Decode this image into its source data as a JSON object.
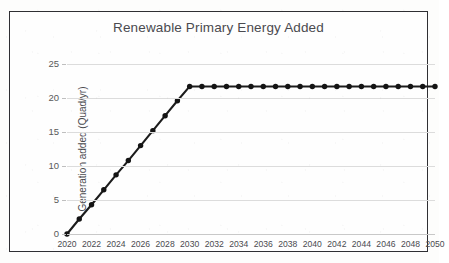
{
  "chart_data": {
    "type": "line",
    "title": "Renewable Primary Energy Added",
    "xlabel": "",
    "ylabel": "Generation added (Quad/yr)",
    "xlim": [
      2020,
      2050
    ],
    "ylim": [
      0,
      25
    ],
    "grid": true,
    "legend": false,
    "legend_position": "none",
    "marker": "circle",
    "line_color": "#1c1c1c",
    "x_tick_labels": [
      "2020",
      "2022",
      "2024",
      "2026",
      "2028",
      "2030",
      "2032",
      "2034",
      "2036",
      "2038",
      "2040",
      "2042",
      "2044",
      "2046",
      "2048",
      "2050"
    ],
    "x_tick_values": [
      2020,
      2022,
      2024,
      2026,
      2028,
      2030,
      2032,
      2034,
      2036,
      2038,
      2040,
      2042,
      2044,
      2046,
      2048,
      2050
    ],
    "y_tick_labels": [
      "0",
      "5",
      "10",
      "15",
      "20",
      "25"
    ],
    "y_tick_values": [
      0,
      5,
      10,
      15,
      20,
      25
    ],
    "x": [
      2020,
      2021,
      2022,
      2023,
      2024,
      2025,
      2026,
      2027,
      2028,
      2029,
      2030,
      2031,
      2032,
      2033,
      2034,
      2035,
      2036,
      2037,
      2038,
      2039,
      2040,
      2041,
      2042,
      2043,
      2044,
      2045,
      2046,
      2047,
      2048,
      2049,
      2050
    ],
    "values": [
      0.0,
      2.2,
      4.3,
      6.5,
      8.7,
      10.8,
      13.0,
      15.2,
      17.4,
      19.6,
      21.7,
      21.7,
      21.7,
      21.7,
      21.7,
      21.7,
      21.7,
      21.7,
      21.7,
      21.7,
      21.7,
      21.7,
      21.7,
      21.7,
      21.7,
      21.7,
      21.7,
      21.7,
      21.7,
      21.7,
      21.7
    ],
    "series": [
      {
        "name": "Renewable primary energy added",
        "values": [
          0.0,
          2.2,
          4.3,
          6.5,
          8.7,
          10.8,
          13.0,
          15.2,
          17.4,
          19.6,
          21.7,
          21.7,
          21.7,
          21.7,
          21.7,
          21.7,
          21.7,
          21.7,
          21.7,
          21.7,
          21.7,
          21.7,
          21.7,
          21.7,
          21.7,
          21.7,
          21.7,
          21.7,
          21.7,
          21.7,
          21.7
        ]
      }
    ],
    "annotations": []
  }
}
